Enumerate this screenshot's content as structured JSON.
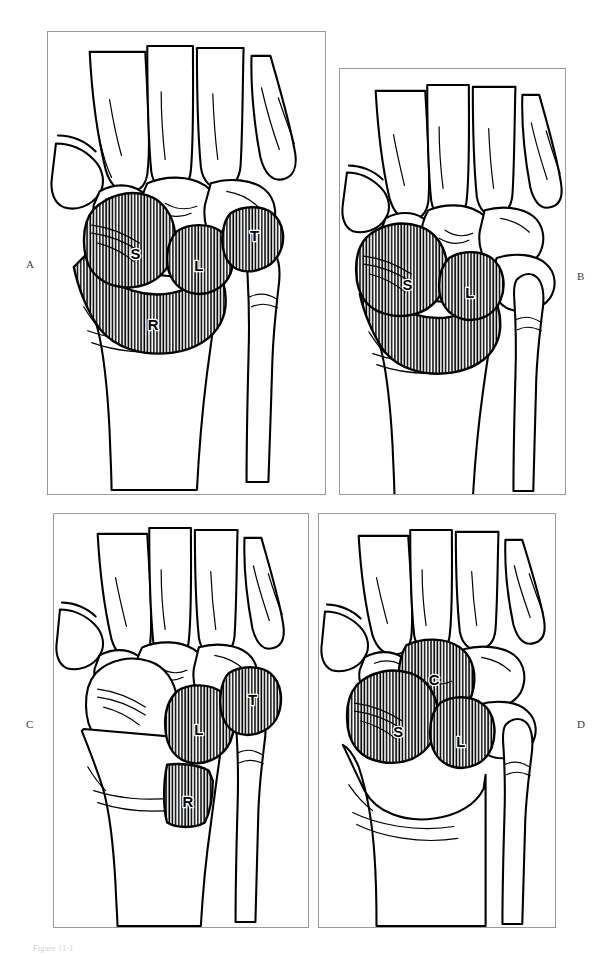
{
  "figure": {
    "type": "medical-illustration",
    "caption": "Figure 11-1",
    "panel_count": 4,
    "hatch_color": "#000000",
    "frame_color": "#9a9a9a",
    "background": "#ffffff"
  },
  "panels": [
    {
      "id": "A",
      "letter": "A",
      "letter_side": "left",
      "shaded_bones": [
        {
          "code": "S",
          "name": "scaphoid"
        },
        {
          "code": "L",
          "name": "lunate"
        },
        {
          "code": "T",
          "name": "triquetrum"
        },
        {
          "code": "R",
          "name": "radius"
        }
      ],
      "labels": [
        "S",
        "L",
        "T",
        "R"
      ]
    },
    {
      "id": "B",
      "letter": "B",
      "letter_side": "right",
      "shaded_bones": [
        {
          "code": "S",
          "name": "scaphoid"
        },
        {
          "code": "L",
          "name": "lunate"
        },
        {
          "code": "",
          "name": "radius (unlabeled)"
        }
      ],
      "labels": [
        "S",
        "L"
      ]
    },
    {
      "id": "C",
      "letter": "C",
      "letter_side": "left",
      "shaded_bones": [
        {
          "code": "L",
          "name": "lunate"
        },
        {
          "code": "T",
          "name": "triquetrum"
        },
        {
          "code": "R",
          "name": "radius"
        }
      ],
      "labels": [
        "L",
        "T",
        "R"
      ]
    },
    {
      "id": "D",
      "letter": "D",
      "letter_side": "right",
      "shaded_bones": [
        {
          "code": "C",
          "name": "capitate"
        },
        {
          "code": "S",
          "name": "scaphoid"
        },
        {
          "code": "L",
          "name": "lunate"
        }
      ],
      "labels": [
        "C",
        "S",
        "L"
      ]
    }
  ]
}
